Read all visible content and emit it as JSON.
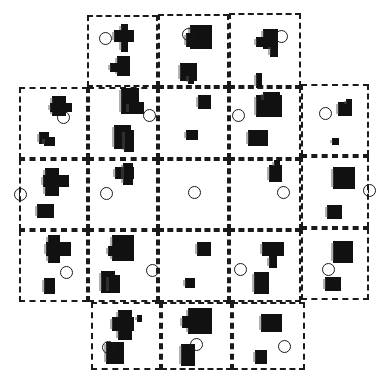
{
  "figure": {
    "colors": {
      "ink": "#111111",
      "border": "#1a1a1a",
      "background": "#ffffff"
    },
    "panels": [
      {
        "id": "r0c1",
        "x": 87,
        "y": 15,
        "w": 71,
        "h": 72,
        "circle": {
          "x": 105,
          "y": 38,
          "tick": false
        },
        "blobs": [
          [
            121,
            24,
            7,
            28
          ],
          [
            114,
            30,
            20,
            12
          ],
          [
            117,
            56,
            13,
            20
          ],
          [
            110,
            63,
            10,
            9
          ]
        ]
      },
      {
        "id": "r0c2",
        "x": 158,
        "y": 14,
        "w": 71,
        "h": 73,
        "circle": {
          "x": 188,
          "y": 34,
          "tick": false
        },
        "blobs": [
          [
            190,
            25,
            22,
            24
          ],
          [
            186,
            33,
            8,
            14
          ],
          [
            180,
            63,
            17,
            18
          ],
          [
            188,
            74,
            6,
            10
          ]
        ]
      },
      {
        "id": "r0c3",
        "x": 229,
        "y": 13,
        "w": 72,
        "h": 74,
        "circle": {
          "x": 281,
          "y": 36,
          "tick": false
        },
        "blobs": [
          [
            263,
            29,
            15,
            20
          ],
          [
            256,
            37,
            9,
            10
          ],
          [
            270,
            45,
            8,
            12
          ],
          [
            256,
            73,
            6,
            15
          ]
        ]
      },
      {
        "id": "r1c0",
        "x": 19,
        "y": 87,
        "w": 69,
        "h": 72,
        "circle": {
          "x": 63,
          "y": 117,
          "tick": false
        },
        "blobs": [
          [
            52,
            96,
            14,
            20
          ],
          [
            50,
            103,
            22,
            9
          ],
          [
            39,
            132,
            10,
            12
          ],
          [
            44,
            137,
            11,
            9
          ]
        ]
      },
      {
        "id": "r1c1",
        "x": 88,
        "y": 87,
        "w": 70,
        "h": 72,
        "circle": {
          "x": 149,
          "y": 115,
          "tick": false
        },
        "blobs": [
          [
            121,
            88,
            18,
            26
          ],
          [
            128,
            102,
            16,
            12
          ],
          [
            114,
            125,
            17,
            24
          ],
          [
            124,
            130,
            10,
            22
          ]
        ]
      },
      {
        "id": "r1c2",
        "x": 158,
        "y": 87,
        "w": 71,
        "h": 72,
        "circle": null,
        "blobs": [
          [
            198,
            95,
            13,
            14
          ],
          [
            186,
            130,
            12,
            10
          ]
        ]
      },
      {
        "id": "r1c3",
        "x": 229,
        "y": 87,
        "w": 72,
        "h": 72,
        "circle": {
          "x": 238,
          "y": 115,
          "tick": false
        },
        "blobs": [
          [
            256,
            95,
            26,
            22
          ],
          [
            263,
            92,
            17,
            10
          ],
          [
            248,
            130,
            20,
            16
          ]
        ]
      },
      {
        "id": "r1c4",
        "x": 301,
        "y": 84,
        "w": 68,
        "h": 72,
        "circle": {
          "x": 325,
          "y": 113,
          "tick": false
        },
        "blobs": [
          [
            338,
            102,
            14,
            14
          ],
          [
            346,
            99,
            6,
            7
          ],
          [
            332,
            138,
            7,
            7
          ]
        ]
      },
      {
        "id": "r2c0",
        "x": 19,
        "y": 159,
        "w": 69,
        "h": 71,
        "circle": {
          "x": 20,
          "y": 194,
          "tick": true
        },
        "blobs": [
          [
            45,
            168,
            14,
            28
          ],
          [
            43,
            175,
            26,
            12
          ],
          [
            37,
            204,
            17,
            14
          ]
        ]
      },
      {
        "id": "r2c1",
        "x": 88,
        "y": 159,
        "w": 70,
        "h": 71,
        "circle": {
          "x": 106,
          "y": 193,
          "tick": false
        },
        "blobs": [
          [
            115,
            167,
            19,
            12
          ],
          [
            123,
            163,
            10,
            22
          ]
        ]
      },
      {
        "id": "r2c2",
        "x": 158,
        "y": 159,
        "w": 71,
        "h": 71,
        "circle": {
          "x": 194,
          "y": 192,
          "tick": false
        },
        "blobs": []
      },
      {
        "id": "r2c3",
        "x": 229,
        "y": 159,
        "w": 72,
        "h": 71,
        "circle": {
          "x": 283,
          "y": 192,
          "tick": false
        },
        "blobs": [
          [
            269,
            165,
            13,
            17
          ],
          [
            274,
            160,
            6,
            8
          ]
        ]
      },
      {
        "id": "r2c4",
        "x": 301,
        "y": 156,
        "w": 68,
        "h": 72,
        "circle": {
          "x": 369,
          "y": 190,
          "tick": true
        },
        "blobs": [
          [
            333,
            167,
            22,
            22
          ],
          [
            327,
            205,
            15,
            14
          ]
        ]
      },
      {
        "id": "r3c0",
        "x": 19,
        "y": 230,
        "w": 69,
        "h": 72,
        "circle": {
          "x": 66,
          "y": 272,
          "tick": false
        },
        "blobs": [
          [
            48,
            235,
            12,
            28
          ],
          [
            46,
            242,
            25,
            14
          ],
          [
            44,
            278,
            11,
            16
          ]
        ]
      },
      {
        "id": "r3c1",
        "x": 88,
        "y": 230,
        "w": 70,
        "h": 72,
        "circle": {
          "x": 152,
          "y": 270,
          "tick": false
        },
        "blobs": [
          [
            112,
            235,
            22,
            26
          ],
          [
            108,
            246,
            10,
            10
          ],
          [
            101,
            271,
            14,
            22
          ],
          [
            108,
            275,
            12,
            18
          ]
        ]
      },
      {
        "id": "r3c2",
        "x": 158,
        "y": 230,
        "w": 71,
        "h": 72,
        "circle": null,
        "blobs": [
          [
            197,
            242,
            14,
            14
          ],
          [
            185,
            278,
            10,
            10
          ]
        ]
      },
      {
        "id": "r3c3",
        "x": 229,
        "y": 230,
        "w": 72,
        "h": 72,
        "circle": {
          "x": 240,
          "y": 269,
          "tick": false
        },
        "blobs": [
          [
            262,
            242,
            22,
            14
          ],
          [
            269,
            256,
            8,
            12
          ],
          [
            254,
            272,
            15,
            22
          ]
        ]
      },
      {
        "id": "r3c4",
        "x": 301,
        "y": 228,
        "w": 68,
        "h": 72,
        "circle": {
          "x": 328,
          "y": 269,
          "tick": false
        },
        "blobs": [
          [
            333,
            241,
            20,
            22
          ],
          [
            325,
            277,
            16,
            14
          ]
        ]
      },
      {
        "id": "r4c1",
        "x": 91,
        "y": 302,
        "w": 70,
        "h": 68,
        "circle": {
          "x": 108,
          "y": 347,
          "tick": false
        },
        "blobs": [
          [
            118,
            310,
            14,
            30
          ],
          [
            112,
            317,
            22,
            14
          ],
          [
            137,
            315,
            5,
            7
          ],
          [
            106,
            342,
            18,
            22
          ]
        ]
      },
      {
        "id": "r4c2",
        "x": 161,
        "y": 302,
        "w": 71,
        "h": 68,
        "circle": {
          "x": 196,
          "y": 344,
          "tick": false
        },
        "blobs": [
          [
            188,
            308,
            24,
            26
          ],
          [
            182,
            316,
            8,
            12
          ],
          [
            181,
            344,
            14,
            22
          ]
        ]
      },
      {
        "id": "r4c3",
        "x": 232,
        "y": 302,
        "w": 73,
        "h": 68,
        "circle": {
          "x": 284,
          "y": 346,
          "tick": false
        },
        "blobs": [
          [
            261,
            314,
            21,
            18
          ],
          [
            255,
            350,
            12,
            14
          ]
        ]
      }
    ]
  }
}
